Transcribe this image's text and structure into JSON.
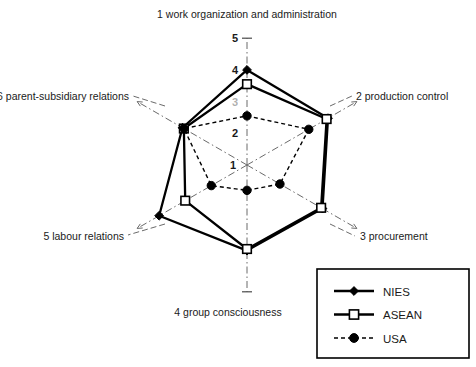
{
  "chart_data": {
    "type": "radar",
    "title": "",
    "categories": [
      "1 work organization and administration",
      "2 production control",
      "3 procurement",
      "4  group consciousness",
      "5 labour relations",
      "6 parent-subsidiary relations"
    ],
    "tick_labels": [
      "1",
      "2",
      "3",
      "4",
      "5"
    ],
    "tick_values": [
      1,
      2,
      3,
      4,
      5
    ],
    "rlim": [
      1,
      5
    ],
    "grid": false,
    "legend_position": "bottom-right",
    "series": [
      {
        "name": "NIES",
        "marker": "filled-diamond",
        "line": "solid",
        "color": "#000000",
        "values": [
          4.0,
          3.95,
          3.75,
          3.7,
          4.2,
          3.35
        ]
      },
      {
        "name": "ASEAN",
        "marker": "open-square",
        "line": "solid",
        "color": "#000000",
        "values": [
          3.55,
          3.9,
          3.7,
          3.65,
          3.25,
          3.3
        ]
      },
      {
        "name": "USA",
        "marker": "filled-circle",
        "line": "dashed",
        "color": "#000000",
        "values": [
          2.55,
          3.25,
          2.2,
          1.8,
          2.3,
          3.3
        ]
      }
    ]
  },
  "legend": {
    "entries": [
      {
        "label": "NIES"
      },
      {
        "label": "ASEAN"
      },
      {
        "label": "USA"
      }
    ]
  }
}
